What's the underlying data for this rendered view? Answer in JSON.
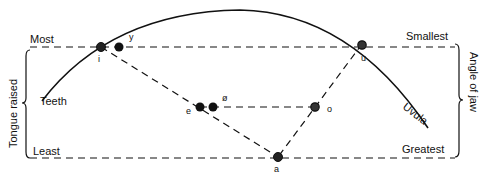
{
  "diagram": {
    "type": "vowel-quadrilateral",
    "left_axis": {
      "label": "Tongue raised",
      "top": "Most",
      "bottom": "Least"
    },
    "right_axis": {
      "label": "Angle of jaw",
      "top": "Smallest",
      "bottom": "Greatest"
    },
    "curve_labels": {
      "front": "Teeth",
      "back": "Uvula"
    },
    "points": [
      {
        "id": "i",
        "label": "i",
        "x": 101,
        "y": 47
      },
      {
        "id": "y",
        "label": "y",
        "x": 119,
        "y": 47
      },
      {
        "id": "u",
        "label": "u",
        "x": 362,
        "y": 44
      },
      {
        "id": "e",
        "label": "e",
        "x": 200,
        "y": 107
      },
      {
        "id": "phi",
        "label": "ø",
        "x": 213,
        "y": 107
      },
      {
        "id": "o",
        "label": "o",
        "x": 315,
        "y": 107
      },
      {
        "id": "a",
        "label": "a",
        "x": 278,
        "y": 157
      }
    ],
    "colors": {
      "ink": "#111111",
      "background": "#ffffff"
    }
  }
}
